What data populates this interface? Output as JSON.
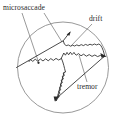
{
  "figure": {
    "background_color": "#ffffff",
    "ink_color": "#2a2a2a",
    "outline_color": "#8d8d8d",
    "labels": {
      "microsaccade": "microsaccade",
      "drift": "drift",
      "tremor": "tremor"
    },
    "label_positions": {
      "microsaccade": {
        "x": 3,
        "y": 9
      },
      "drift": {
        "x": 89,
        "y": 20
      },
      "tremor": {
        "x": 78,
        "y": 88
      }
    },
    "circle": {
      "cx": 63,
      "cy": 67.5,
      "r": 45.5
    },
    "leader_lines": [
      {
        "name": "microsaccade-leader-left",
        "x1": 22,
        "y1": 12,
        "x2": 38,
        "y2": 62
      },
      {
        "name": "microsaccade-leader-right",
        "x1": 44,
        "y1": 12,
        "x2": 62,
        "y2": 42
      },
      {
        "name": "drift-leader",
        "x1": 92,
        "y1": 24,
        "x2": 72,
        "y2": 46
      },
      {
        "name": "tremor-leader",
        "x1": 88,
        "y1": 83,
        "x2": 79,
        "y2": 55
      }
    ],
    "trace": {
      "description": "jagged fixational eye-movement path with tremor micro-oscillations, slow drift segments and fast straight microsaccades",
      "microsaccade_segments": [
        {
          "name": "upper-left-microsaccade",
          "from": {
            "x": 18,
            "y": 66
          },
          "to": {
            "x": 63,
            "y": 41
          }
        },
        {
          "name": "upper-right-microsaccade",
          "from": {
            "x": 63,
            "y": 41
          },
          "to": {
            "x": 69,
            "y": 33
          }
        },
        {
          "name": "lower-right-microsaccade",
          "from": {
            "x": 78,
            "y": 57
          },
          "to": {
            "x": 55,
            "y": 96
          }
        }
      ],
      "drift_segments": [
        {
          "name": "upper-drift",
          "from": {
            "x": 66,
            "y": 46
          },
          "to": {
            "x": 100,
            "y": 43
          }
        },
        {
          "name": "right-drift",
          "from": {
            "x": 100,
            "y": 43
          },
          "to": {
            "x": 104,
            "y": 56
          }
        }
      ],
      "tremor_segments": [
        {
          "name": "left-tremor-run",
          "from": {
            "x": 31,
            "y": 58
          },
          "to": {
            "x": 62,
            "y": 64
          }
        },
        {
          "name": "central-tremor-run",
          "from": {
            "x": 62,
            "y": 64
          },
          "to": {
            "x": 73,
            "y": 52
          }
        },
        {
          "name": "lower-tremor-run",
          "from": {
            "x": 65,
            "y": 72
          },
          "to": {
            "x": 57,
            "y": 100
          }
        }
      ],
      "arrowheads": [
        {
          "name": "arrowhead-upper-right",
          "x": 70,
          "y": 32,
          "angle": -52
        },
        {
          "name": "arrowhead-far-right",
          "x": 105,
          "y": 56,
          "angle": 20
        },
        {
          "name": "arrowhead-bottom",
          "x": 55,
          "y": 99,
          "angle": 108
        }
      ],
      "dot_markers": [
        {
          "name": "origin-dot",
          "x": 38,
          "y": 63
        }
      ]
    }
  }
}
